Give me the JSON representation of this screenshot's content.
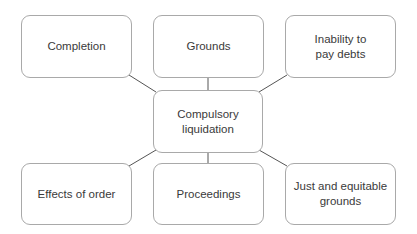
{
  "diagram": {
    "center": {
      "label": "Compulsory\nliquidation",
      "line1": "Compulsory",
      "line2": "liquidation"
    },
    "nodes": [
      {
        "id": "completion",
        "line1": "Completion",
        "line2": ""
      },
      {
        "id": "grounds",
        "line1": "Grounds",
        "line2": ""
      },
      {
        "id": "inability",
        "line1": "Inability to",
        "line2": "pay debts"
      },
      {
        "id": "effects",
        "line1": "Effects of order",
        "line2": ""
      },
      {
        "id": "proceedings",
        "line1": "Proceedings",
        "line2": ""
      },
      {
        "id": "just",
        "line1": "Just and equitable",
        "line2": "grounds"
      }
    ],
    "colors": {
      "border": "#a9a9a9",
      "line": "#555555",
      "text": "#3a3a3a",
      "background": "#ffffff"
    }
  }
}
